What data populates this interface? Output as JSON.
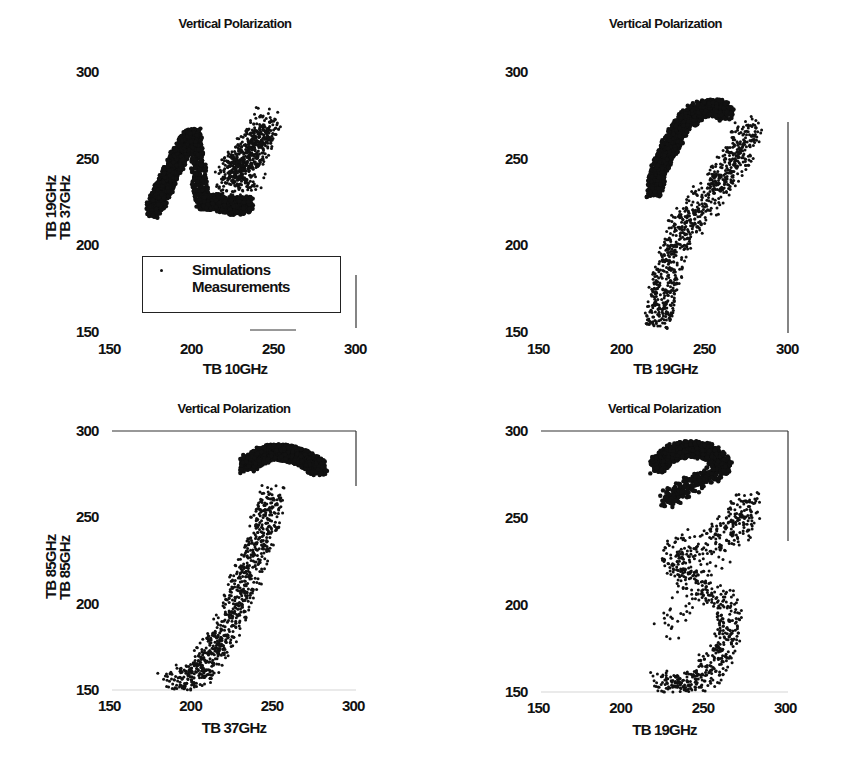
{
  "chart_data": [
    {
      "type": "scatter",
      "title": "Vertical Polarization",
      "xlabel": "TB 10GHz",
      "ylabel": "TB 19GHz",
      "xlim": [
        150,
        300
      ],
      "ylim": [
        150,
        300
      ],
      "xticks": [
        "150",
        "200",
        "250",
        "300"
      ],
      "yticks": [
        "150",
        "200",
        "250",
        "300"
      ],
      "legend": {
        "entries": [
          "Simulations",
          "Measurements"
        ],
        "position": "lower center"
      },
      "series": [
        {
          "name": "Simulations",
          "description": "dense dark cluster, L-shaped; upper arm from (175,220) to (200,265), lower base 175-235 at 218-232",
          "points": [
            [
              175,
              220
            ],
            [
              180,
              230
            ],
            [
              185,
              240
            ],
            [
              190,
              250
            ],
            [
              195,
              258
            ],
            [
              200,
              263
            ],
            [
              205,
              225
            ],
            [
              215,
              225
            ],
            [
              225,
              222
            ],
            [
              232,
              224
            ]
          ]
        },
        {
          "name": "Measurements",
          "description": "scattered points spreading up-right from base (215-235,220-230) to (245,275)",
          "points": [
            [
              220,
              235
            ],
            [
              225,
              245
            ],
            [
              230,
              250
            ],
            [
              235,
              255
            ],
            [
              240,
              262
            ],
            [
              245,
              272
            ],
            [
              228,
              238
            ],
            [
              236,
              242
            ]
          ]
        }
      ]
    },
    {
      "type": "scatter",
      "title": "Vertical Polarization",
      "xlabel": "TB 19GHz",
      "ylabel": "TB 37GHz",
      "xlim": [
        150,
        300
      ],
      "ylim": [
        150,
        300
      ],
      "xticks": [
        "150",
        "200",
        "250",
        "300"
      ],
      "yticks": [
        "150",
        "200",
        "250",
        "300"
      ],
      "series": [
        {
          "name": "Simulations",
          "description": "dense arc from (218,232) curving up to (250,280) and (262,275)",
          "points": [
            [
              218,
              232
            ],
            [
              222,
              245
            ],
            [
              228,
              258
            ],
            [
              235,
              270
            ],
            [
              245,
              278
            ],
            [
              255,
              280
            ],
            [
              262,
              276
            ]
          ]
        },
        {
          "name": "Measurements",
          "description": "wedge from (220,152) widening upward to (225-275,250)",
          "points": [
            [
              220,
              152
            ],
            [
              222,
              165
            ],
            [
              225,
              180
            ],
            [
              230,
              195
            ],
            [
              235,
              210
            ],
            [
              245,
              220
            ],
            [
              255,
              235
            ],
            [
              262,
              245
            ],
            [
              270,
              255
            ],
            [
              275,
              268
            ]
          ]
        }
      ]
    },
    {
      "type": "scatter",
      "title": "Vertical Polarization",
      "xlabel": "TB 37GHz",
      "ylabel": "TB 85GHz",
      "xlim": [
        150,
        300
      ],
      "ylim": [
        150,
        300
      ],
      "xticks": [
        "150",
        "200",
        "250",
        "300"
      ],
      "yticks": [
        "150",
        "200",
        "250",
        "300"
      ],
      "series": [
        {
          "name": "Simulations",
          "description": "dense blob near top (230-280, 270-290)",
          "points": [
            [
              232,
              280
            ],
            [
              240,
              285
            ],
            [
              250,
              288
            ],
            [
              260,
              287
            ],
            [
              270,
              283
            ],
            [
              278,
              278
            ]
          ]
        },
        {
          "name": "Measurements",
          "description": "diagonal band from (185,150) to (250,265)",
          "points": [
            [
              185,
              152
            ],
            [
              200,
              158
            ],
            [
              208,
              165
            ],
            [
              215,
              175
            ],
            [
              222,
              190
            ],
            [
              228,
              205
            ],
            [
              235,
              220
            ],
            [
              240,
              235
            ],
            [
              245,
              250
            ],
            [
              250,
              262
            ]
          ]
        }
      ]
    },
    {
      "type": "scatter",
      "title": "Vertical Polarization",
      "xlabel": "TB 19GHz",
      "ylabel": "TB 85GHz",
      "xlim": [
        150,
        300
      ],
      "ylim": [
        150,
        300
      ],
      "xticks": [
        "150",
        "200",
        "250",
        "300"
      ],
      "yticks": [
        "150",
        "200",
        "250",
        "300"
      ],
      "series": [
        {
          "name": "Simulations",
          "description": "dense arc near top (220-265, 255-290)",
          "points": [
            [
              220,
              280
            ],
            [
              228,
              287
            ],
            [
              240,
              290
            ],
            [
              252,
              288
            ],
            [
              262,
              280
            ],
            [
              225,
              260
            ]
          ]
        },
        {
          "name": "Measurements",
          "description": "vertical column spanning x 220-275 from y 150 to 265",
          "points": [
            [
              222,
              155
            ],
            [
              235,
              152
            ],
            [
              250,
              160
            ],
            [
              262,
              175
            ],
            [
              265,
              200
            ],
            [
              240,
              215
            ],
            [
              230,
              230
            ],
            [
              270,
              245
            ],
            [
              275,
              258
            ],
            [
              225,
              185
            ]
          ]
        }
      ]
    }
  ]
}
